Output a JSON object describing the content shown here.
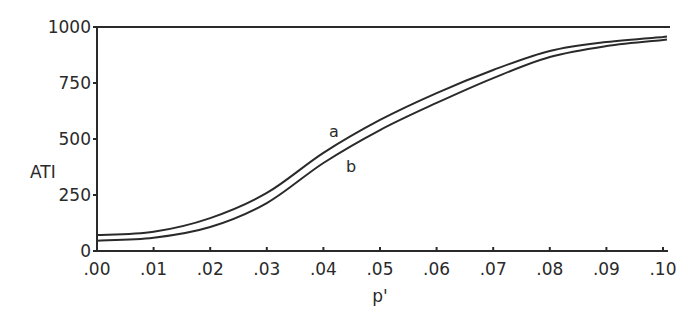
{
  "chart_data": {
    "type": "line",
    "title": "",
    "xlabel": "p'",
    "ylabel": "ATI",
    "xlim": [
      0.0,
      0.1
    ],
    "ylim": [
      0,
      1000
    ],
    "grid": false,
    "legend": "none (curves labeled inline 'a' and 'b')",
    "x_tick_labels": [
      ".00",
      ".01",
      ".02",
      ".03",
      ".04",
      ".05",
      ".06",
      ".07",
      ".08",
      ".09",
      ".10"
    ],
    "y_tick_labels": [
      "0",
      "250",
      "500",
      "750",
      "1000"
    ],
    "x": [
      0.0,
      0.01,
      0.02,
      0.03,
      0.04,
      0.05,
      0.06,
      0.07,
      0.08,
      0.09,
      0.1
    ],
    "series": [
      {
        "name": "a",
        "values": [
          71,
          86,
          147,
          259,
          438,
          585,
          705,
          808,
          893,
          933,
          955
        ]
      },
      {
        "name": "b",
        "values": [
          46,
          59,
          107,
          214,
          393,
          540,
          661,
          772,
          866,
          915,
          942
        ]
      }
    ],
    "annotations": [
      {
        "text": "a",
        "near_x": 0.042,
        "position": "above curve a"
      },
      {
        "text": "b",
        "near_x": 0.045,
        "position": "below curve b"
      }
    ],
    "reference_line": {
      "y": 1000,
      "description": "horizontal line at ATI = 1000"
    }
  }
}
